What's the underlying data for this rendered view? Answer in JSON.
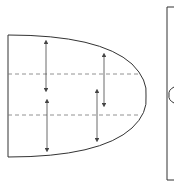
{
  "diagram": {
    "type": "schematic",
    "colors": {
      "stroke": "#333333",
      "dashed": "#777777",
      "arrow": "#444444",
      "background": "#ffffff"
    },
    "shape": {
      "left_x": 8,
      "top_y": 35,
      "bottom_y": 157,
      "tip_x": 146,
      "tip_y": 96
    },
    "dashed_lines": [
      {
        "y": 74,
        "x1": 8,
        "x2": 140
      },
      {
        "y": 115,
        "x1": 8,
        "x2": 141
      }
    ],
    "arrows": [
      {
        "x": 46,
        "y1": 42,
        "y2": 90
      },
      {
        "x": 47,
        "y1": 101,
        "y2": 150
      },
      {
        "x": 104,
        "y1": 55,
        "y2": 105
      },
      {
        "x": 97,
        "y1": 91,
        "y2": 140
      }
    ],
    "right_panel": {
      "x": 167,
      "top_y": 7,
      "bottom_y": 180,
      "arc_y": 95
    }
  }
}
